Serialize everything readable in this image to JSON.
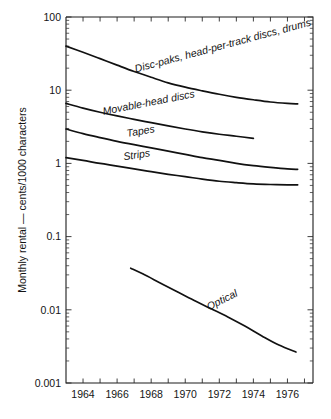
{
  "chart_data": {
    "type": "line",
    "title": "",
    "xlabel": "",
    "ylabel": "Monthly rental — cents/1000 characters",
    "x_scale": "linear",
    "y_scale": "log",
    "xlim": [
      1963,
      1977.5
    ],
    "ylim": [
      0.001,
      100
    ],
    "grid": false,
    "legend_position": "inline-labels-on-curves",
    "x_tick_labels": [
      "1964",
      "1966",
      "1968",
      "1970",
      "1972",
      "1974",
      "1976"
    ],
    "x_tick_values": [
      1964,
      1966,
      1968,
      1970,
      1972,
      1974,
      1976
    ],
    "x_minor_tick_values": [
      1965,
      1967,
      1969,
      1971,
      1973,
      1975,
      1977
    ],
    "y_tick_labels": [
      "100",
      "10",
      "1",
      "0.1",
      "0.01",
      "0.001"
    ],
    "y_tick_values": [
      100,
      10,
      1,
      0.1,
      0.01,
      0.001
    ],
    "series": [
      {
        "name": "Disc-paks, head-per-track discs, drums",
        "label": "Disc-paks, head-per-track discs, drums",
        "label_x": 1967.1,
        "label_y": 17.5,
        "label_rotation": -15,
        "x": [
          1963.0,
          1964.0,
          1965.0,
          1966.0,
          1967.0,
          1968.0,
          1969.0,
          1970.0,
          1971.0,
          1972.0,
          1973.0,
          1974.0,
          1975.0,
          1976.0,
          1976.6
        ],
        "y": [
          40.0,
          33.0,
          27.0,
          22.0,
          18.0,
          15.0,
          12.6,
          11.0,
          9.8,
          8.8,
          8.0,
          7.4,
          6.9,
          6.6,
          6.5
        ]
      },
      {
        "name": "Movable-head discs",
        "label": "Movable-head discs",
        "label_x": 1965.2,
        "label_y": 4.6,
        "label_rotation": -11,
        "x": [
          1963.0,
          1964.0,
          1965.0,
          1966.0,
          1967.0,
          1968.0,
          1969.0,
          1970.0,
          1971.0,
          1972.0,
          1973.0,
          1974.0
        ],
        "y": [
          6.6,
          5.7,
          5.0,
          4.45,
          4.0,
          3.6,
          3.25,
          2.95,
          2.7,
          2.5,
          2.35,
          2.2
        ]
      },
      {
        "name": "Tapes",
        "label": "Tapes",
        "label_x": 1966.6,
        "label_y": 2.3,
        "label_rotation": -10,
        "x": [
          1963.0,
          1964.0,
          1965.0,
          1966.0,
          1967.0,
          1968.0,
          1969.0,
          1970.0,
          1971.0,
          1972.0,
          1973.0,
          1974.0,
          1975.0,
          1976.0,
          1976.6
        ],
        "y": [
          2.95,
          2.55,
          2.25,
          2.0,
          1.8,
          1.63,
          1.47,
          1.33,
          1.2,
          1.1,
          1.0,
          0.93,
          0.88,
          0.84,
          0.83
        ]
      },
      {
        "name": "Strips",
        "label": "Strips",
        "label_x": 1966.4,
        "label_y": 1.1,
        "label_rotation": -9,
        "x": [
          1963.0,
          1964.0,
          1965.0,
          1966.0,
          1967.0,
          1968.0,
          1969.0,
          1970.0,
          1971.0,
          1972.0,
          1973.0,
          1974.0,
          1975.0,
          1976.0,
          1976.6
        ],
        "y": [
          1.2,
          1.1,
          1.0,
          0.92,
          0.84,
          0.77,
          0.71,
          0.66,
          0.61,
          0.57,
          0.545,
          0.525,
          0.515,
          0.51,
          0.51
        ]
      },
      {
        "name": "Optical",
        "label": "Optical",
        "label_x": 1971.4,
        "label_y": 0.0098,
        "label_rotation": -27,
        "x": [
          1966.8,
          1967.5,
          1968.5,
          1969.5,
          1970.5,
          1971.5,
          1972.5,
          1973.5,
          1974.5,
          1975.5,
          1976.5
        ],
        "y": [
          0.037,
          0.031,
          0.0235,
          0.0178,
          0.0135,
          0.0104,
          0.008,
          0.006,
          0.0044,
          0.0033,
          0.00265
        ]
      }
    ]
  },
  "colors": {
    "line": "#111111",
    "axis": "#1d1d1d",
    "text": "#141414",
    "background": "#ffffff"
  }
}
